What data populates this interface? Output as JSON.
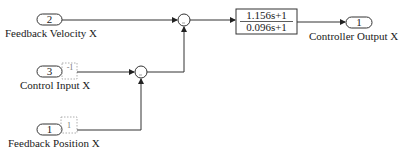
{
  "diagram": {
    "inports": [
      {
        "number": "2",
        "label": "Feedback Velocity X"
      },
      {
        "number": "3",
        "label": "Control Input X"
      },
      {
        "number": "1",
        "label": "Feedback Position X"
      }
    ],
    "outport": {
      "number": "1",
      "label": "Controller Output X"
    },
    "transfer_function": {
      "numerator": "1.156s+1",
      "denominator": "0.096s+1"
    },
    "sum_blocks": [
      {
        "id": "sum1",
        "inputs": [
          "Feedback Velocity X",
          "sum2 output"
        ]
      },
      {
        "id": "sum2",
        "inputs": [
          "Control Input X",
          "Feedback Position X"
        ]
      }
    ],
    "conversion_tags": [
      "-1",
      "1"
    ],
    "colors": {
      "line": "#333333",
      "background": "#ffffff"
    }
  }
}
